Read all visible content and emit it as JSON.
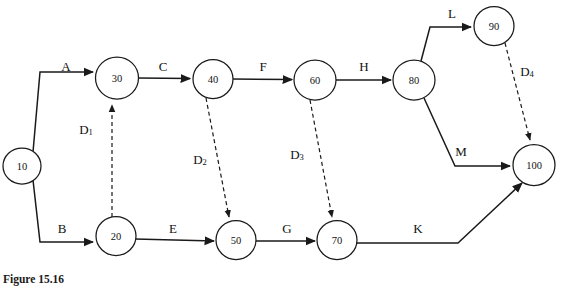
{
  "figure": {
    "caption": "Figure 15.16",
    "type": "activity-on-arrow-network",
    "background_color": "#ffffff",
    "line_color": "#1a1a1a"
  },
  "nodes": [
    {
      "id": "10",
      "label": "10",
      "cx": 22,
      "cy": 166,
      "r": 18
    },
    {
      "id": "20",
      "label": "20",
      "cx": 116,
      "cy": 236,
      "r": 19
    },
    {
      "id": "30",
      "label": "30",
      "cx": 117,
      "cy": 78,
      "r": 21
    },
    {
      "id": "40",
      "label": "40",
      "cx": 213,
      "cy": 79,
      "r": 19
    },
    {
      "id": "50",
      "label": "50",
      "cx": 236,
      "cy": 240,
      "r": 19
    },
    {
      "id": "60",
      "label": "60",
      "cx": 315,
      "cy": 80,
      "r": 20
    },
    {
      "id": "70",
      "label": "70",
      "cx": 337,
      "cy": 240,
      "r": 19
    },
    {
      "id": "80",
      "label": "80",
      "cx": 414,
      "cy": 80,
      "r": 20
    },
    {
      "id": "90",
      "label": "90",
      "cx": 494,
      "cy": 26,
      "r": 19
    },
    {
      "id": "100",
      "label": "100",
      "cx": 534,
      "cy": 165,
      "r": 20
    }
  ],
  "activities": [
    {
      "label": "A",
      "from": "10",
      "to": "30",
      "lx": 66,
      "ly": 66,
      "style": "solid"
    },
    {
      "label": "B",
      "from": "10",
      "to": "20",
      "lx": 62,
      "ly": 228,
      "style": "solid"
    },
    {
      "label": "C",
      "from": "30",
      "to": "40",
      "lx": 163,
      "ly": 66,
      "style": "solid"
    },
    {
      "label": "E",
      "from": "20",
      "to": "50",
      "lx": 173,
      "ly": 228,
      "style": "solid"
    },
    {
      "label": "F",
      "from": "40",
      "to": "60",
      "lx": 263,
      "ly": 66,
      "style": "solid"
    },
    {
      "label": "G",
      "from": "50",
      "to": "70",
      "lx": 287,
      "ly": 228,
      "style": "solid"
    },
    {
      "label": "H",
      "from": "60",
      "to": "80",
      "lx": 364,
      "ly": 66,
      "style": "solid"
    },
    {
      "label": "L",
      "from": "80",
      "to": "90",
      "lx": 452,
      "ly": 13,
      "style": "solid"
    },
    {
      "label": "M",
      "from": "80",
      "to": "100",
      "lx": 461,
      "ly": 151,
      "style": "solid"
    },
    {
      "label": "K",
      "from": "70",
      "to": "100",
      "lx": 418,
      "ly": 228,
      "style": "solid"
    }
  ],
  "dummies": [
    {
      "label": "D",
      "sub": "1",
      "from": "20",
      "to": "30",
      "lx": 86,
      "ly": 129
    },
    {
      "label": "D",
      "sub": "2",
      "from": "40",
      "to": "50",
      "lx": 200,
      "ly": 159
    },
    {
      "label": "D",
      "sub": "3",
      "from": "60",
      "to": "70",
      "lx": 297,
      "ly": 154
    },
    {
      "label": "D",
      "sub": "4",
      "from": "90",
      "to": "100",
      "lx": 527,
      "ly": 71
    }
  ]
}
